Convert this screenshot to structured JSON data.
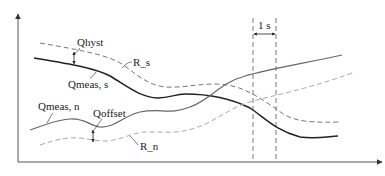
{
  "diagram": {
    "labels": {
      "qhyst": "Qhyst",
      "r_s": "R_s",
      "qmeas_s": "Qmeas, s",
      "qmeas_n": "Qmeas, n",
      "qoffset": "Qoffset",
      "r_n": "R_n",
      "interval": "1 s"
    },
    "colors": {
      "axis": "#555555",
      "qmeas_s": "#222222",
      "qmeas_n": "#666666",
      "r_s": "#777777",
      "r_n": "#aaaaaa",
      "guide": "#555555"
    }
  }
}
